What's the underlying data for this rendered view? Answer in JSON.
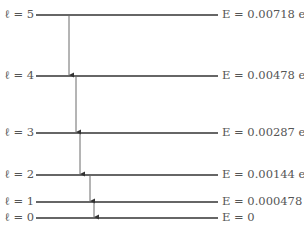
{
  "diagram": {
    "type": "energy-level-diagram",
    "levels": [
      {
        "l_label": "ℓ = 5",
        "energy_label": "E = 0.00718 eV",
        "y": 15
      },
      {
        "l_label": "ℓ = 4",
        "energy_label": "E = 0.00478 eV",
        "y": 76
      },
      {
        "l_label": "ℓ = 3",
        "energy_label": "E = 0.00287 eV",
        "y": 133
      },
      {
        "l_label": "ℓ = 2",
        "energy_label": "E = 0.00144 eV",
        "y": 175
      },
      {
        "l_label": "ℓ = 1",
        "energy_label": "E = 0.000478 eV",
        "y": 202
      },
      {
        "l_label": "ℓ = 0",
        "energy_label": "E = 0",
        "y": 218
      }
    ],
    "transitions": [
      {
        "from": "ℓ = 5",
        "to": "ℓ = 4",
        "x": 69
      },
      {
        "from": "ℓ = 4",
        "to": "ℓ = 3",
        "x": 76
      },
      {
        "from": "ℓ = 3",
        "to": "ℓ = 2",
        "x": 80
      },
      {
        "from": "ℓ = 2",
        "to": "ℓ = 1",
        "x": 90
      },
      {
        "from": "ℓ = 1",
        "to": "ℓ = 0",
        "x": 94
      }
    ],
    "line_color": "#333333",
    "text_color": "#555555"
  }
}
